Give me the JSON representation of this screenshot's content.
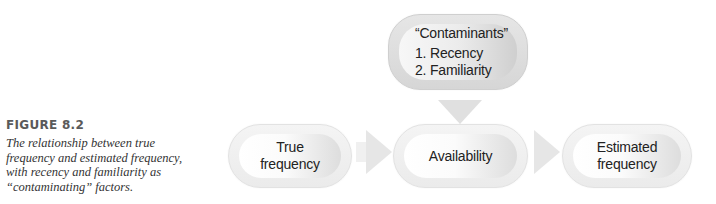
{
  "caption": {
    "label": "FIGURE 8.2",
    "text": "The relationship between true frequency and estimated frequency, with recency and familiarity as “contaminating” factors."
  },
  "diagram": {
    "contaminants": {
      "title": "“Contaminants”",
      "items": [
        "1. Recency",
        "2. Familiarity"
      ]
    },
    "flow": [
      {
        "line1": "True",
        "line2": "frequency"
      },
      {
        "line1": "Availability",
        "line2": ""
      },
      {
        "line1": "Estimated",
        "line2": "frequency"
      }
    ],
    "colors": {
      "box_fill": "#f4f4f4",
      "box_shade": "#dddddd",
      "arrow": "#e6e6e6",
      "text": "#222222"
    }
  }
}
